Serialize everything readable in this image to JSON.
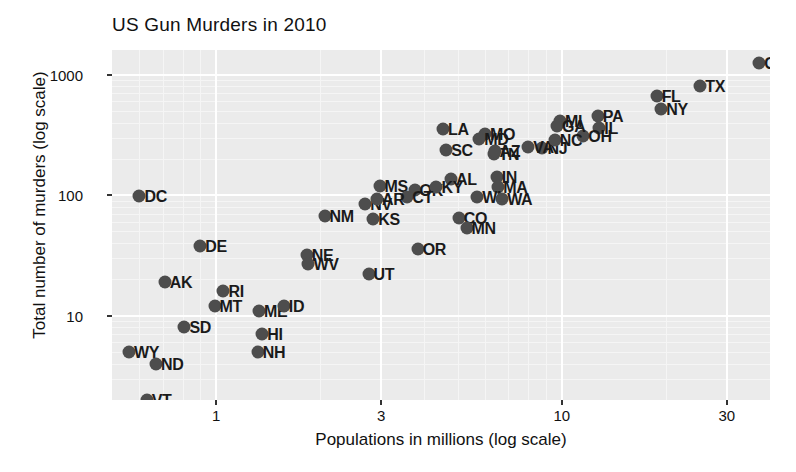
{
  "chart_data": {
    "type": "scatter",
    "title": "US Gun Murders in 2010",
    "xlabel": "Populations in millions (log scale)",
    "ylabel": "Total number of murders (log scale)",
    "xscale": "log",
    "yscale": "log",
    "xlim": [
      0.5,
      40
    ],
    "ylim": [
      2,
      1600
    ],
    "grid": true,
    "legend": "none",
    "xticks": [
      1,
      3,
      10,
      30
    ],
    "xtick_labels": [
      "1",
      "3",
      "10",
      "30"
    ],
    "yticks": [
      10,
      100,
      1000
    ],
    "ytick_labels": [
      "10",
      "100",
      "1000"
    ],
    "point_color": "#4d4d4d",
    "panel_color": "#ebebeb",
    "grid_color": "#ffffff",
    "points": [
      {
        "label": "CA",
        "x": 37.25,
        "y": 1257
      },
      {
        "label": "TX",
        "x": 25.15,
        "y": 805
      },
      {
        "label": "FL",
        "x": 18.8,
        "y": 669
      },
      {
        "label": "NY",
        "x": 19.38,
        "y": 517
      },
      {
        "label": "PA",
        "x": 12.7,
        "y": 457
      },
      {
        "label": "IL",
        "x": 12.83,
        "y": 364
      },
      {
        "label": "OH",
        "x": 11.54,
        "y": 310
      },
      {
        "label": "MI",
        "x": 9.88,
        "y": 413
      },
      {
        "label": "MO",
        "x": 5.99,
        "y": 321
      },
      {
        "label": "LA",
        "x": 4.53,
        "y": 351
      },
      {
        "label": "NJ",
        "x": 8.79,
        "y": 246
      },
      {
        "label": "MD",
        "x": 5.77,
        "y": 293
      },
      {
        "label": "SC",
        "x": 4.63,
        "y": 239
      },
      {
        "label": "VA",
        "x": 8.0,
        "y": 250
      },
      {
        "label": "NC",
        "x": 9.54,
        "y": 286
      },
      {
        "label": "GA",
        "x": 9.69,
        "y": 376
      },
      {
        "label": "TN",
        "x": 6.35,
        "y": 219
      },
      {
        "label": "AZ",
        "x": 6.39,
        "y": 232
      },
      {
        "label": "AL",
        "x": 4.78,
        "y": 135
      },
      {
        "label": "IN",
        "x": 6.48,
        "y": 142
      },
      {
        "label": "MA",
        "x": 6.55,
        "y": 118
      },
      {
        "label": "WI",
        "x": 5.69,
        "y": 97
      },
      {
        "label": "WA",
        "x": 6.72,
        "y": 93
      },
      {
        "label": "MS",
        "x": 2.97,
        "y": 120
      },
      {
        "label": "OK",
        "x": 3.75,
        "y": 111
      },
      {
        "label": "KY",
        "x": 4.34,
        "y": 116
      },
      {
        "label": "CT",
        "x": 3.57,
        "y": 97
      },
      {
        "label": "NV",
        "x": 2.7,
        "y": 84
      },
      {
        "label": "AR",
        "x": 2.92,
        "y": 93
      },
      {
        "label": "NM",
        "x": 2.06,
        "y": 67
      },
      {
        "label": "KS",
        "x": 2.85,
        "y": 63
      },
      {
        "label": "CO",
        "x": 5.03,
        "y": 65
      },
      {
        "label": "MN",
        "x": 5.3,
        "y": 53
      },
      {
        "label": "OR",
        "x": 3.83,
        "y": 36
      },
      {
        "label": "NE",
        "x": 1.83,
        "y": 32
      },
      {
        "label": "WV",
        "x": 1.85,
        "y": 27
      },
      {
        "label": "UT",
        "x": 2.76,
        "y": 22
      },
      {
        "label": "DC",
        "x": 0.6,
        "y": 99
      },
      {
        "label": "DE",
        "x": 0.9,
        "y": 38
      },
      {
        "label": "AK",
        "x": 0.71,
        "y": 19
      },
      {
        "label": "RI",
        "x": 1.05,
        "y": 16
      },
      {
        "label": "MT",
        "x": 0.99,
        "y": 12
      },
      {
        "label": "ME",
        "x": 1.33,
        "y": 11
      },
      {
        "label": "ID",
        "x": 1.57,
        "y": 12
      },
      {
        "label": "SD",
        "x": 0.81,
        "y": 8
      },
      {
        "label": "HI",
        "x": 1.36,
        "y": 7
      },
      {
        "label": "NH",
        "x": 1.32,
        "y": 5
      },
      {
        "label": "WY",
        "x": 0.56,
        "y": 5
      },
      {
        "label": "ND",
        "x": 0.67,
        "y": 4
      },
      {
        "label": "VT",
        "x": 0.63,
        "y": 2
      }
    ]
  }
}
